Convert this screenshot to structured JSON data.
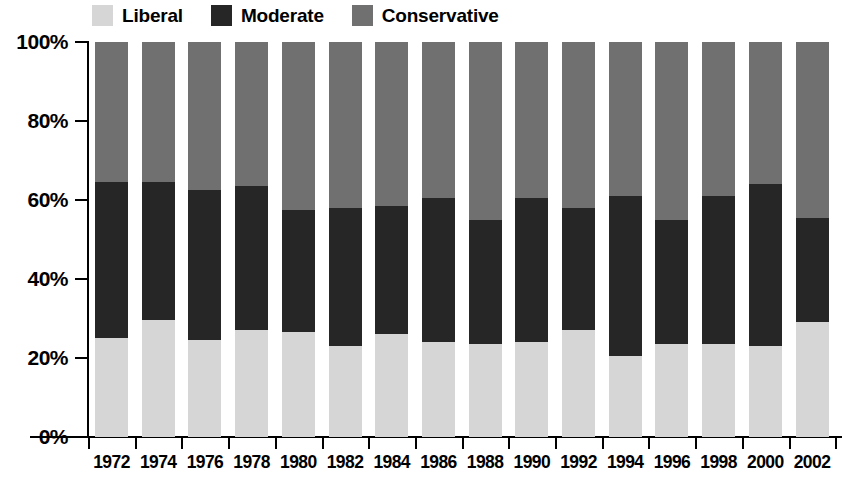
{
  "chart_data": {
    "type": "bar",
    "stacked": true,
    "normalized_percent": true,
    "title": "",
    "subtitle": "",
    "xlabel": "",
    "ylabel": "",
    "ylim": [
      0,
      100
    ],
    "yticks": [
      0,
      20,
      40,
      60,
      80,
      100
    ],
    "ytick_labels": [
      "0%",
      "20%",
      "40%",
      "60%",
      "80%",
      "100%"
    ],
    "grid": false,
    "legend_position": "top",
    "categories": [
      "1972",
      "1974",
      "1976",
      "1978",
      "1980",
      "1982",
      "1984",
      "1986",
      "1988",
      "1990",
      "1992",
      "1994",
      "1996",
      "1998",
      "2000",
      "2002"
    ],
    "series": [
      {
        "name": "Liberal",
        "color": "#d6d6d6",
        "values": [
          25,
          29.5,
          24.5,
          27,
          26.5,
          23,
          26,
          24,
          23.5,
          24,
          27,
          20.5,
          23.5,
          23.5,
          23,
          29
        ]
      },
      {
        "name": "Moderate",
        "color": "#262626",
        "values": [
          39.5,
          35,
          38,
          36.5,
          31,
          35,
          32.5,
          36.5,
          31.5,
          36.5,
          31,
          40.5,
          31.5,
          37.5,
          41,
          26.5
        ]
      },
      {
        "name": "Conservative",
        "color": "#707070",
        "values": [
          35.5,
          35.5,
          37.5,
          36.5,
          42.5,
          42,
          41.5,
          39.5,
          45,
          39.5,
          42,
          39,
          45,
          39,
          36,
          44.5
        ]
      }
    ],
    "cumulative_tops": {
      "liberal_top": [
        25,
        29.5,
        24.5,
        27,
        26.5,
        23,
        26,
        24,
        23.5,
        24,
        27,
        20.5,
        23.5,
        23.5,
        23,
        29
      ],
      "moderate_top": [
        64.5,
        64.5,
        62.5,
        63.5,
        57.5,
        58,
        58.5,
        60.5,
        55,
        60.5,
        58,
        61,
        55,
        61,
        64,
        55.5
      ],
      "conservative_top": [
        100,
        100,
        100,
        100,
        100,
        100,
        100,
        100,
        100,
        100,
        100,
        100,
        100,
        100,
        100,
        100
      ]
    }
  },
  "legend": {
    "items": [
      {
        "label": "Liberal",
        "color": "#d6d6d6"
      },
      {
        "label": "Moderate",
        "color": "#262626"
      },
      {
        "label": "Conservative",
        "color": "#707070"
      }
    ]
  },
  "axes": {
    "y": {
      "labels": [
        "100%",
        "80%",
        "60%",
        "40%",
        "20%",
        "0%"
      ],
      "values": [
        100,
        80,
        60,
        40,
        20,
        0
      ]
    },
    "x": {
      "labels": [
        "1972",
        "1974",
        "1976",
        "1978",
        "1980",
        "1982",
        "1984",
        "1986",
        "1988",
        "1990",
        "1992",
        "1994",
        "1996",
        "1998",
        "2000",
        "2002"
      ]
    }
  },
  "colors": {
    "liberal": "#d6d6d6",
    "moderate": "#262626",
    "conservative": "#707070",
    "axis": "#000000",
    "background": "#ffffff"
  }
}
